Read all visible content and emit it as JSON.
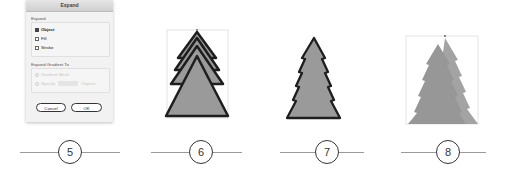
{
  "dialog": {
    "title": "Expand",
    "expand_group": {
      "label": "Expand",
      "options": [
        {
          "label": "Object",
          "checked": true
        },
        {
          "label": "Fill",
          "checked": false
        },
        {
          "label": "Stroke",
          "checked": false
        }
      ]
    },
    "gradient_group": {
      "label": "Expand Gradient To",
      "gradient_mesh_label": "Gradient Mesh",
      "specify_label": "Specify",
      "specify_value": "",
      "objects_label": "Objects"
    },
    "cancel_label": "Cancel",
    "ok_label": "OK"
  },
  "steps": [
    {
      "number": "5"
    },
    {
      "number": "6"
    },
    {
      "number": "7"
    },
    {
      "number": "8"
    }
  ],
  "colors": {
    "tree_fill": "#9a9a9a",
    "tree_stroke": "#1e1e1e",
    "bbox": "#c8c8c8"
  }
}
